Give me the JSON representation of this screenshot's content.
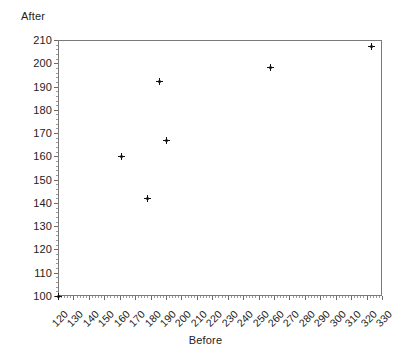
{
  "chart_data": {
    "type": "scatter",
    "title": "",
    "xlabel": "Before",
    "ylabel": "After",
    "xlim": [
      120,
      330
    ],
    "ylim": [
      100,
      210
    ],
    "xticks": [
      120,
      130,
      140,
      150,
      160,
      170,
      180,
      190,
      200,
      210,
      220,
      230,
      240,
      250,
      260,
      270,
      280,
      290,
      300,
      310,
      320,
      330
    ],
    "yticks": [
      100,
      110,
      120,
      130,
      140,
      150,
      160,
      170,
      180,
      190,
      200,
      210
    ],
    "xtick_labels": [
      "120",
      "130",
      "140",
      "150",
      "160",
      "170",
      "180",
      "190",
      "200",
      "210",
      "220",
      "230",
      "240",
      "250",
      "260",
      "270",
      "280",
      "290",
      "300",
      "310",
      "320",
      "330"
    ],
    "ytick_labels": [
      "100",
      "110",
      "120",
      "130",
      "140",
      "150",
      "160",
      "170",
      "180",
      "190",
      "200",
      "210"
    ],
    "grid": false,
    "legend": null,
    "marker": "plus",
    "marker_color": "#111111",
    "points": [
      {
        "x": 120,
        "y": 100
      },
      {
        "x": 161,
        "y": 160
      },
      {
        "x": 178,
        "y": 142
      },
      {
        "x": 186,
        "y": 192
      },
      {
        "x": 190,
        "y": 167
      },
      {
        "x": 258,
        "y": 198
      },
      {
        "x": 323,
        "y": 207
      }
    ],
    "x": [
      120,
      161,
      178,
      186,
      190,
      258,
      323
    ],
    "y": [
      100,
      160,
      142,
      192,
      167,
      198,
      207
    ]
  },
  "axis_title_y": "After",
  "axis_title_x": "Before"
}
